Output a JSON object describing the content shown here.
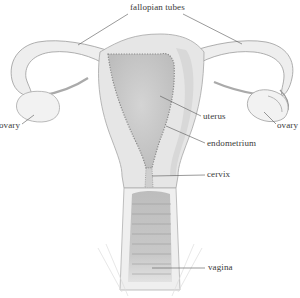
{
  "diagram": {
    "labels": {
      "fallopian_tubes": "fallopian tubes",
      "ovary_left": "ovary",
      "ovary_right": "ovary",
      "uterus": "uterus",
      "endometrium": "endometrium",
      "cervix": "cervix",
      "vagina": "vagina"
    },
    "colors": {
      "background": "#ffffff",
      "line": "#555555",
      "tissue_light": "#eeeeee",
      "tissue_mid": "#d6d6d6",
      "tissue_dark": "#b8b8b8",
      "label_text": "#3a3a3a"
    }
  }
}
